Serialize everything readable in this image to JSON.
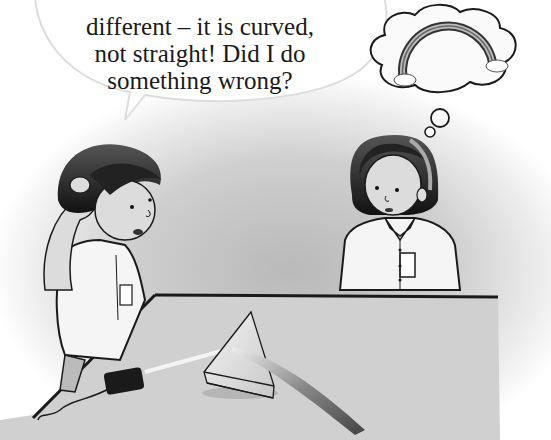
{
  "scene": {
    "description": "Textbook illustration: a boy scratching his head beside a table with a ray box and a glass prism; a girl looks on, thinking of a rainbow.",
    "speech_bubble": {
      "speaker": "boy",
      "lines": [
        "different – it is curved,",
        "not straight! Did I do",
        "something wrong?"
      ],
      "partial_top_line_cut_off": true
    },
    "thought_bubble": {
      "thinker": "girl",
      "content": "rainbow-with-clouds"
    },
    "objects": [
      "ray-box",
      "triangular-glass-prism",
      "light-ray",
      "curved-light-beam",
      "table"
    ],
    "palette": {
      "background": "#ffffff",
      "shading": "#c4c4c4",
      "outline": "#1a1a1a",
      "table_top": "#d2d2d2"
    }
  }
}
